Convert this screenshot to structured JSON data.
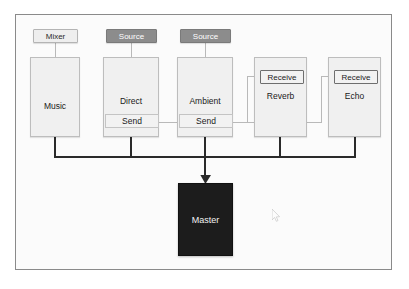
{
  "diagram": {
    "colors": {
      "frame_border": "#8a8a8a",
      "frame_background": "#fbfbfb",
      "track_fill": "#f0f0f0",
      "track_border": "#bdbdbd",
      "source_header_fill": "#8c8c8c",
      "source_header_text": "#ffffff",
      "mixer_header_fill": "#eeeeee",
      "receive_border": "#6e6e6e",
      "master_fill": "#1c1c1c",
      "master_text": "#f2f2f2",
      "bus_line": "#2a2a2a",
      "send_line": "#b9b9b9"
    },
    "headers": [
      {
        "id": "mixer",
        "label": "Mixer",
        "style": "mixer"
      },
      {
        "id": "source_direct",
        "label": "Source",
        "style": "source"
      },
      {
        "id": "source_ambient",
        "label": "Source",
        "style": "source"
      }
    ],
    "tracks": [
      {
        "id": "music",
        "label": "Music",
        "has_send": false,
        "send_label": ""
      },
      {
        "id": "direct",
        "label": "Direct",
        "has_send": true,
        "send_label": "Send"
      },
      {
        "id": "ambient",
        "label": "Ambient",
        "has_send": true,
        "send_label": "Send"
      },
      {
        "id": "reverb",
        "label": "Reverb",
        "has_send": false,
        "send_label": ""
      },
      {
        "id": "echo",
        "label": "Echo",
        "has_send": false,
        "send_label": ""
      }
    ],
    "receives": [
      {
        "id": "reverb_receive",
        "label": "Receive"
      },
      {
        "id": "echo_receive",
        "label": "Receive"
      }
    ],
    "master": {
      "label": "Master"
    }
  }
}
